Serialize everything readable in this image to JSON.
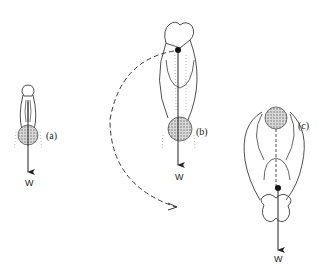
{
  "figure": {
    "panels": [
      {
        "id": "a",
        "label": "(a)",
        "force_label": "W"
      },
      {
        "id": "b",
        "label": "(b)",
        "force_label": "W"
      },
      {
        "id": "c",
        "label": "(c)",
        "force_label": "W"
      }
    ],
    "colors": {
      "ink": "#222222",
      "stipple": "#9a9a9a",
      "background": "#ffffff"
    }
  }
}
